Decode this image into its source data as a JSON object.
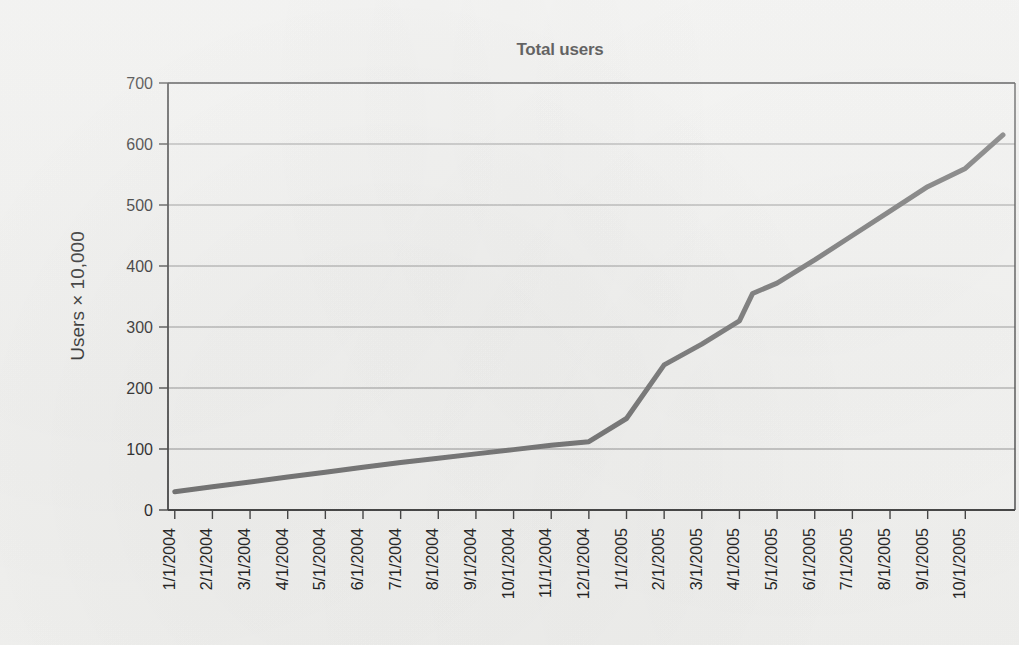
{
  "figure": {
    "background_color": "#f3f3f1",
    "ink_color": "#1b1b1b"
  },
  "chart_data": {
    "type": "line",
    "title": "Total users",
    "xlabel": "",
    "ylabel": "Users × 10,000",
    "ylim": [
      0,
      700
    ],
    "yticks": [
      0,
      100,
      200,
      300,
      400,
      500,
      600,
      700
    ],
    "ytick_labels": [
      "0",
      "100",
      "200",
      "300",
      "400",
      "500",
      "600",
      "700"
    ],
    "grid": true,
    "grid_axis": "y",
    "legend": false,
    "legend_position": "none",
    "line_color": "#6b6b6b",
    "line_width": 5,
    "markers": false,
    "categories": [
      "1/1/2004",
      "2/1/2004",
      "3/1/2004",
      "4/1/2004",
      "5/1/2004",
      "6/1/2004",
      "7/1/2004",
      "8/1/2004",
      "9/1/2004",
      "10/1/2004",
      "11/1/2004",
      "12/1/2004",
      "1/1/2005",
      "2/1/2005",
      "3/1/2005",
      "4/1/2005",
      "5/1/2005",
      "6/1/2005",
      "7/1/2005",
      "8/1/2005",
      "9/1/2005",
      "10/1/2005"
    ],
    "series": [
      {
        "name": "Total users",
        "values": [
          30,
          38,
          46,
          54,
          62,
          70,
          78,
          85,
          92,
          99,
          106,
          112,
          150,
          238,
          272,
          310,
          372,
          410,
          450,
          490,
          530,
          560
        ]
      }
    ],
    "extra_points": [
      {
        "label": "4/1/2005 jump top",
        "x_category_index": 15.35,
        "value": 355
      },
      {
        "label": "series end (past last tick)",
        "x_category_index": 22.0,
        "value": 615
      }
    ],
    "annotations": [
      {
        "text": "slow linear growth through 2004",
        "x_category_index": 5,
        "value": 70
      },
      {
        "text": "steep acceleration from 1/1/2005",
        "x_category_index": 13,
        "value": 238
      },
      {
        "text": "step jump at 4/1/2005 to ~355",
        "x_category_index": 15.35,
        "value": 355
      }
    ]
  }
}
